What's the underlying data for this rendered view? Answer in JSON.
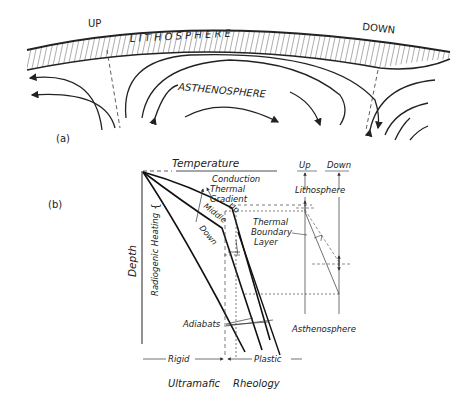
{
  "panel_a": {
    "label": "(a)",
    "up_label": "UP",
    "down_label": "DOWN",
    "lithosphere_label": "L I T H O S P H E R E",
    "asthenosphere_label": "ASTHENOSPHERE"
  },
  "panel_b": {
    "label": "(b)",
    "temperature_axis": "Temperature",
    "depth_axis": "Depth",
    "radiogenic_heating": "Radiogenic  Heating",
    "conduction": "Conduction",
    "thermal": "Thermal",
    "gradient": "Gradient",
    "curve_up": "Up",
    "curve_middle": "Middle",
    "curve_down": "Down",
    "tbl_1": "Thermal",
    "tbl_2": "Boundary",
    "tbl_3": "Layer",
    "adiabats": "Adiabats",
    "rigid": "Rigid",
    "plastic": "Plastic",
    "rheology_1": "Ultramafic",
    "rheology_2": "Rheology",
    "col_up": "Up",
    "col_down": "Down",
    "lithosphere": "Lithosphere",
    "asthenosphere": "Asthenosphere"
  },
  "colors": {
    "ink": "#222222",
    "background": "#ffffff"
  }
}
